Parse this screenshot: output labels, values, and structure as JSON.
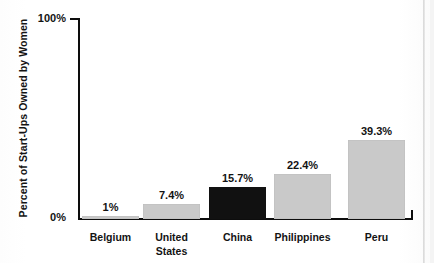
{
  "chart_data": {
    "type": "bar",
    "title": "",
    "xlabel": "",
    "ylabel": "Percent of Start-Ups Owned by Women",
    "categories": [
      "Belgium",
      "United\nStates",
      "China",
      "Philippines",
      "Peru"
    ],
    "values": [
      1,
      7.4,
      15.7,
      22.4,
      39.3
    ],
    "value_labels": [
      "1%",
      "7.4%",
      "15.7%",
      "22.4%",
      "39.3%"
    ],
    "ylim": [
      0,
      100
    ],
    "ytick_labels": [
      "0%",
      "100%"
    ],
    "grid": false,
    "legend": "none",
    "highlight_index": 2,
    "colors": {
      "bar": "#c9c9c9",
      "bar_highlight": "#111111",
      "axis": "#0d0d0d",
      "text": "#131313",
      "background": "#ffffff"
    }
  },
  "axis": {
    "y_top_label": "100%",
    "y_bottom_label": "0%",
    "y_title": "Percent of Start-Ups Owned by Women"
  },
  "bars": [
    {
      "category": "Belgium",
      "value_label": "1%",
      "value": 1
    },
    {
      "category": "United\nStates",
      "value_label": "7.4%",
      "value": 7.4
    },
    {
      "category": "China",
      "value_label": "15.7%",
      "value": 15.7
    },
    {
      "category": "Philippines",
      "value_label": "22.4%",
      "value": 22.4
    },
    {
      "category": "Peru",
      "value_label": "39.3%",
      "value": 39.3
    }
  ]
}
